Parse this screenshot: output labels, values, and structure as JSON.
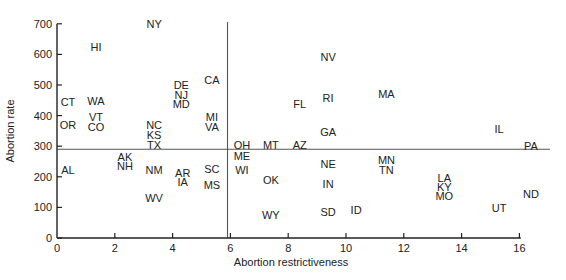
{
  "chart_data": {
    "type": "scatter",
    "title": "",
    "xlabel": "Abortion restrictiveness",
    "ylabel": "Abortion rate",
    "xlim": [
      0,
      17
    ],
    "ylim": [
      0,
      700
    ],
    "xticks": [
      0,
      2,
      4,
      6,
      8,
      10,
      12,
      14,
      16
    ],
    "yticks": [
      0,
      100,
      200,
      300,
      400,
      500,
      600,
      700
    ],
    "grid": false,
    "legend": null,
    "reference_lines": {
      "vertical_x": 5.9,
      "horizontal_y": 290
    },
    "points": [
      {
        "label": "NY",
        "x": 3.36,
        "y": 700
      },
      {
        "label": "HI",
        "x": 1.35,
        "y": 625
      },
      {
        "label": "CT",
        "x": 0.38,
        "y": 445
      },
      {
        "label": "WA",
        "x": 1.35,
        "y": 448
      },
      {
        "label": "VT",
        "x": 1.35,
        "y": 395
      },
      {
        "label": "CO",
        "x": 1.35,
        "y": 363
      },
      {
        "label": "OR",
        "x": 0.38,
        "y": 370
      },
      {
        "label": "NC",
        "x": 3.36,
        "y": 370
      },
      {
        "label": "KS",
        "x": 3.36,
        "y": 337
      },
      {
        "label": "TX",
        "x": 3.36,
        "y": 304
      },
      {
        "label": "DE",
        "x": 4.3,
        "y": 500
      },
      {
        "label": "NJ",
        "x": 4.3,
        "y": 467
      },
      {
        "label": "MD",
        "x": 4.3,
        "y": 438
      },
      {
        "label": "CA",
        "x": 5.36,
        "y": 516
      },
      {
        "label": "MI",
        "x": 5.36,
        "y": 395
      },
      {
        "label": "VA",
        "x": 5.36,
        "y": 363
      },
      {
        "label": "OH",
        "x": 6.4,
        "y": 304
      },
      {
        "label": "MT",
        "x": 7.4,
        "y": 304
      },
      {
        "label": "AZ",
        "x": 8.4,
        "y": 304
      },
      {
        "label": "FL",
        "x": 8.4,
        "y": 438
      },
      {
        "label": "NV",
        "x": 9.38,
        "y": 592
      },
      {
        "label": "RI",
        "x": 9.38,
        "y": 458
      },
      {
        "label": "MA",
        "x": 11.4,
        "y": 471
      },
      {
        "label": "GA",
        "x": 9.38,
        "y": 346
      },
      {
        "label": "IL",
        "x": 15.3,
        "y": 356
      },
      {
        "label": "PA",
        "x": 16.4,
        "y": 301
      },
      {
        "label": "ME",
        "x": 6.4,
        "y": 268
      },
      {
        "label": "WI",
        "x": 6.4,
        "y": 222
      },
      {
        "label": "OK",
        "x": 7.4,
        "y": 190
      },
      {
        "label": "NE",
        "x": 9.38,
        "y": 242
      },
      {
        "label": "IN",
        "x": 9.38,
        "y": 176
      },
      {
        "label": "SD",
        "x": 9.38,
        "y": 85
      },
      {
        "label": "ID",
        "x": 10.35,
        "y": 92
      },
      {
        "label": "WY",
        "x": 7.4,
        "y": 75
      },
      {
        "label": "MN",
        "x": 11.4,
        "y": 255
      },
      {
        "label": "TN",
        "x": 11.4,
        "y": 222
      },
      {
        "label": "LA",
        "x": 13.4,
        "y": 196
      },
      {
        "label": "KY",
        "x": 13.4,
        "y": 167
      },
      {
        "label": "MO",
        "x": 13.4,
        "y": 137
      },
      {
        "label": "ND",
        "x": 16.4,
        "y": 144
      },
      {
        "label": "UT",
        "x": 15.3,
        "y": 98
      },
      {
        "label": "AL",
        "x": 0.38,
        "y": 222
      },
      {
        "label": "AK",
        "x": 2.35,
        "y": 265
      },
      {
        "label": "NH",
        "x": 2.35,
        "y": 235
      },
      {
        "label": "NM",
        "x": 3.36,
        "y": 222
      },
      {
        "label": "WV",
        "x": 3.36,
        "y": 131
      },
      {
        "label": "AR",
        "x": 4.35,
        "y": 212
      },
      {
        "label": "IA",
        "x": 4.35,
        "y": 183
      },
      {
        "label": "SC",
        "x": 5.36,
        "y": 225
      },
      {
        "label": "MS",
        "x": 5.36,
        "y": 173
      }
    ]
  },
  "colors": {
    "axis": "#222222",
    "reference_line": "#555555",
    "text": "#222222"
  }
}
